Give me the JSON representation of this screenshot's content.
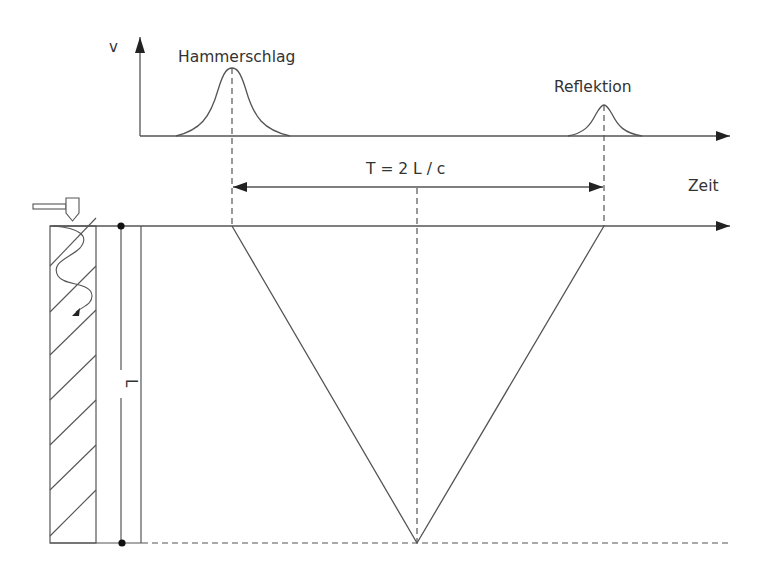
{
  "diagram": {
    "labels": {
      "v_axis": "v",
      "hammer_pulse": "Hammerschlag",
      "reflection_pulse": "Reflektion",
      "period_formula": "T = 2 L / c",
      "time_axis": "Zeit",
      "pile_length": "L"
    },
    "colors": {
      "line": "#555555",
      "text": "#333333",
      "fill": "#222222",
      "background": "#ffffff"
    }
  }
}
